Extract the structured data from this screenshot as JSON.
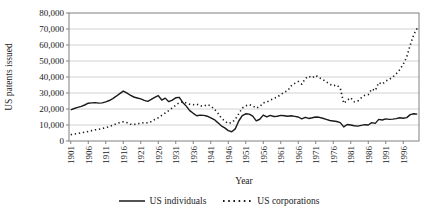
{
  "chart_data": {
    "type": "line",
    "title": "",
    "xlabel": "Year",
    "ylabel": "US patents issued",
    "ylim": [
      0,
      80000
    ],
    "ytick_interval": 10000,
    "ytick_labels": [
      "0",
      "10,000",
      "20,000",
      "30,000",
      "40,000",
      "50,000",
      "60,000",
      "70,000",
      "80,000"
    ],
    "x_start": 1901,
    "x_end": 2000,
    "xtick_every": 5,
    "xtick_labels": [
      "1901",
      "1906",
      "1911",
      "1916",
      "1921",
      "1926",
      "1931",
      "1936",
      "1941",
      "1946",
      "1951",
      "1956",
      "1961",
      "1966",
      "1971",
      "1976",
      "1981",
      "1986",
      "1991",
      "1996"
    ],
    "grid": "horizontal",
    "legend_position": "bottom",
    "axis_color": "#808080",
    "gridline_color": "#c6c6c6",
    "line_color": "#1a1a1a",
    "series": [
      {
        "name": "US individuals",
        "style": "solid",
        "values": [
          19500,
          20300,
          21000,
          21600,
          22500,
          23600,
          23800,
          24000,
          23700,
          23800,
          24500,
          25300,
          26500,
          28000,
          29600,
          31200,
          30100,
          28600,
          27500,
          26900,
          26300,
          25400,
          24800,
          26000,
          27300,
          28400,
          25600,
          26800,
          24600,
          25600,
          27000,
          27300,
          24100,
          21800,
          19000,
          17300,
          15800,
          16200,
          16000,
          15500,
          14500,
          13400,
          11500,
          9500,
          8200,
          6500,
          5800,
          7600,
          12500,
          15800,
          17000,
          16800,
          15500,
          12600,
          13600,
          16200,
          15100,
          16000,
          15300,
          15500,
          16000,
          15800,
          15500,
          15800,
          15400,
          15000,
          13800,
          14800,
          14100,
          14500,
          15000,
          14800,
          14200,
          13500,
          12800,
          12500,
          12200,
          11500,
          8800,
          10300,
          10000,
          9500,
          9300,
          9800,
          10200,
          10000,
          11500,
          11000,
          13500,
          13100,
          13800,
          13500,
          13700,
          14000,
          14500,
          14200,
          14600,
          16500,
          17000,
          16800
        ]
      },
      {
        "name": "US corporations",
        "style": "dotted",
        "values": [
          4000,
          4300,
          4700,
          5100,
          5500,
          6000,
          6500,
          7000,
          7300,
          7800,
          8300,
          9000,
          9800,
          10800,
          11500,
          12000,
          11500,
          10500,
          10300,
          10800,
          11000,
          11500,
          11300,
          12200,
          13400,
          14500,
          16000,
          17500,
          19000,
          20600,
          22300,
          24000,
          24500,
          23800,
          23000,
          22700,
          23000,
          22000,
          21700,
          22700,
          22000,
          20000,
          17500,
          14400,
          12500,
          11000,
          11500,
          13500,
          17000,
          20600,
          22000,
          22700,
          22000,
          20600,
          21500,
          23800,
          24300,
          25500,
          26500,
          27500,
          29000,
          30500,
          31500,
          34500,
          36000,
          37200,
          35500,
          39000,
          40500,
          39500,
          41000,
          39500,
          38500,
          37000,
          35500,
          34500,
          35000,
          33000,
          23500,
          25500,
          27000,
          24500,
          24900,
          27000,
          28500,
          29000,
          32500,
          31500,
          36500,
          35500,
          37500,
          38500,
          40000,
          42000,
          44500,
          48000,
          52500,
          60000,
          66500,
          70500
        ]
      }
    ]
  }
}
